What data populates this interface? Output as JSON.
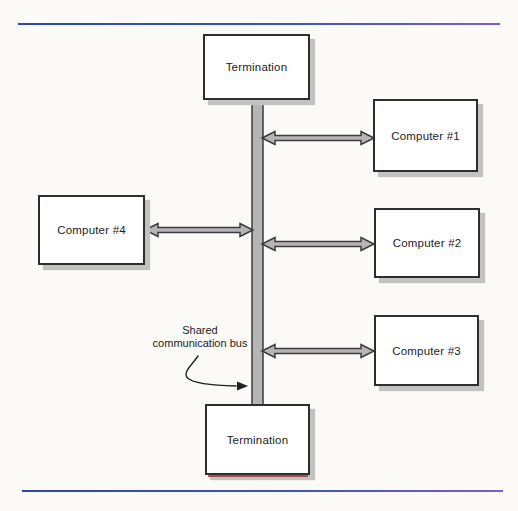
{
  "figure": {
    "type": "bus-network-topology-diagram",
    "colors": {
      "background": "#fbfaf6",
      "rule_blue": "#2e44b4",
      "rule_purple": "#7e5cd4",
      "bus_fill": "#b5b5b5",
      "bus_stroke": "#3c3c3c",
      "arrow_fill": "#b5b5b5",
      "arrow_stroke": "#3c3c3c",
      "box_fill": "#ffffff",
      "box_stroke": "#2e2e2e",
      "box_shadow": "#c2c2c0",
      "text": "#1c1c1c"
    }
  },
  "diagram": {
    "nodes": {
      "termination_top": "Termination",
      "computer_1": "Computer #1",
      "computer_2": "Computer #2",
      "computer_3": "Computer #3",
      "computer_4": "Computer #4",
      "termination_bottom": "Termination"
    },
    "bus_label": {
      "line1": "Shared",
      "line2": "communication bus"
    }
  }
}
